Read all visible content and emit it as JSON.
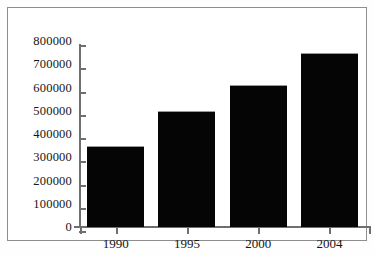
{
  "chart_data": {
    "type": "bar",
    "title": "",
    "subtitle": "",
    "xlabel": "",
    "ylabel": "",
    "categories": [
      "1990",
      "1995",
      "2000",
      "2004"
    ],
    "values": [
      350000,
      500000,
      610000,
      750000
    ],
    "series": [
      {
        "name": "",
        "values": [
          350000,
          500000,
          610000,
          750000
        ]
      }
    ],
    "ylim": [
      0,
      800000
    ],
    "yticks": [
      0,
      100000,
      200000,
      300000,
      400000,
      500000,
      600000,
      700000,
      800000
    ],
    "ytick_labels": [
      "0",
      "100000",
      "200000",
      "300000",
      "400000",
      "500000",
      "600000",
      "700000",
      "800000"
    ],
    "xtick_labels": [
      "1990",
      "1995",
      "2000",
      "2004"
    ],
    "grid": false,
    "legend": false,
    "legend_position": "none",
    "annotations": [],
    "colors": {
      "bar": "#050505",
      "axis": "#6f6f6f",
      "text": "#151515",
      "background": "#ffffff",
      "frame": "#8d8d8d"
    }
  }
}
